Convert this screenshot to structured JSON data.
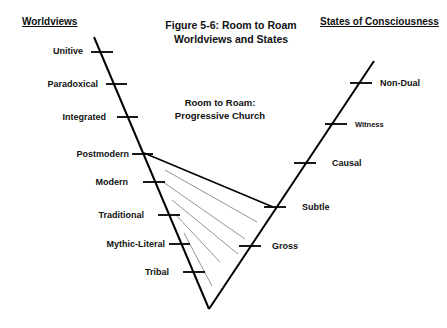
{
  "title": {
    "line1": "Figure 5-6: Room to Roam",
    "line2": "Worldviews and States"
  },
  "headers": {
    "left": "Worldviews",
    "right": "States of Consciousness"
  },
  "region_label": {
    "line1": "Room to Roam:",
    "line2": "Progressive Church"
  },
  "worldviews": [
    {
      "label": "Unitive",
      "level": 8
    },
    {
      "label": "Paradoxical",
      "level": 7
    },
    {
      "label": "Integrated",
      "level": 6
    },
    {
      "label": "Postmodern",
      "level": 5
    },
    {
      "label": "Modern",
      "level": 4
    },
    {
      "label": "Traditional",
      "level": 3
    },
    {
      "label": "Mythic-Literal",
      "level": 2
    },
    {
      "label": "Tribal",
      "level": 1
    }
  ],
  "states": [
    {
      "label": "Non-Dual",
      "level": 5
    },
    {
      "label": "Witness",
      "level": 4
    },
    {
      "label": "Causal",
      "level": 3
    },
    {
      "label": "Subtle",
      "level": 2
    },
    {
      "label": "Gross",
      "level": 1
    }
  ],
  "room_to_roam": {
    "worldview_upper_bound": "Postmodern",
    "state_upper_bound": "Subtle",
    "hatch_lines": 5
  },
  "colors": {
    "axis": "#000000",
    "hatch": "#888888",
    "text": "#111111"
  }
}
